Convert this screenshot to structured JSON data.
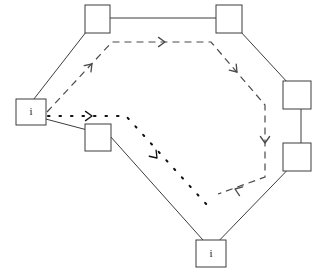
{
  "diagram": {
    "stroke_color": "#3d3d3d",
    "background_color": "#ffffff",
    "dash_color": "#4a4a4a",
    "dot_color": "#111111",
    "label_color": "#1a1a1a",
    "stroke_width": 1
  },
  "polygon": {
    "name": "outer-polygon",
    "points": "97,18 228,18 301,97 301,156 211,249 110,136 23,113",
    "vertices": [
      {
        "id": "v-top-left",
        "x": 97,
        "y": 18
      },
      {
        "id": "v-top-right",
        "x": 228,
        "y": 18
      },
      {
        "id": "v-right-upper",
        "x": 301,
        "y": 97
      },
      {
        "id": "v-right-lower",
        "x": 301,
        "y": 156
      },
      {
        "id": "v-bottom",
        "x": 211,
        "y": 249
      },
      {
        "id": "v-mid-left",
        "x": 110,
        "y": 136
      },
      {
        "id": "v-left",
        "x": 23,
        "y": 113
      }
    ]
  },
  "nodes": [
    {
      "id": "node-top-left",
      "name": "node-box-top-left",
      "label": "",
      "x": 85,
      "y": 5,
      "width": 25,
      "height": 28
    },
    {
      "id": "node-top-right",
      "name": "node-box-top-right",
      "label": "",
      "x": 216,
      "y": 5,
      "width": 26,
      "height": 28
    },
    {
      "id": "node-right-upper",
      "name": "node-box-right-upper",
      "label": "",
      "x": 283,
      "y": 81,
      "width": 28,
      "height": 28
    },
    {
      "id": "node-right-lower",
      "name": "node-box-right-lower",
      "label": "",
      "x": 283,
      "y": 143,
      "width": 28,
      "height": 28
    },
    {
      "id": "node-bottom",
      "name": "node-box-bottom",
      "label": "i",
      "x": 196,
      "y": 240,
      "width": 30,
      "height": 27
    },
    {
      "id": "node-left",
      "name": "node-box-left",
      "label": "i",
      "x": 16,
      "y": 99,
      "width": 30,
      "height": 26
    },
    {
      "id": "node-mid-left",
      "name": "node-box-mid-left",
      "label": "",
      "x": 85,
      "y": 124,
      "width": 26,
      "height": 27
    }
  ],
  "paths": [
    {
      "id": "dashed-route",
      "name": "dashed-route-path",
      "style": "dashed",
      "dash_pattern": "7,5",
      "points": "47,112 112,42 211,42 265,105 265,177 218,194",
      "arrow_markers": [
        {
          "id": "dash-arrow-1",
          "x": 92,
          "y": 64,
          "angle": -47
        },
        {
          "id": "dash-arrow-2",
          "x": 165,
          "y": 42,
          "angle": 0
        },
        {
          "id": "dash-arrow-3",
          "x": 237,
          "y": 72,
          "angle": 49
        },
        {
          "id": "dash-arrow-4",
          "x": 265,
          "y": 143,
          "angle": 90
        },
        {
          "id": "dash-arrow-5",
          "x": 235,
          "y": 189,
          "angle": 200
        }
      ]
    },
    {
      "id": "dotted-route",
      "name": "dotted-route-path",
      "style": "dotted",
      "dash_pattern": "1.5,10",
      "points": "48,116 126,116 208,206",
      "arrow_markers": [
        {
          "id": "dot-arrow-1",
          "x": 92,
          "y": 116,
          "angle": 0
        },
        {
          "id": "dot-arrow-2",
          "x": 157,
          "y": 158,
          "angle": 48
        }
      ]
    }
  ]
}
